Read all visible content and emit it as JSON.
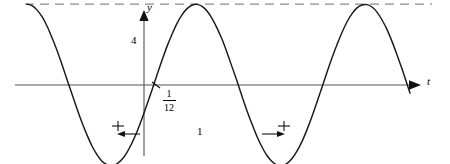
{
  "figure": {
    "title": "",
    "axis_labels": {
      "y": "y",
      "t": "t"
    },
    "annotations": {
      "amplitude_value": "4",
      "period_value": "1",
      "phase_shift_numerator": "1",
      "phase_shift_denominator": "12"
    },
    "icons": {
      "y_axis_arrow": "arrow-up-icon",
      "t_axis_arrow": "arrow-right-icon",
      "shift_arrow_left": "arrow-left-icon",
      "shift_arrow_right": "arrow-right-icon"
    },
    "colors": {
      "curve": "#1a1a1a",
      "axis": "#555555",
      "dashed": "#8c8c8c",
      "background": "#ffffff"
    }
  },
  "chart_data": {
    "type": "line",
    "title": "",
    "xlabel": "t",
    "ylabel": "y",
    "grid": false,
    "legend": null,
    "xlim": [
      -0.71,
      2.02
    ],
    "ylim": [
      -4.6,
      5.2
    ],
    "axis_origin_px": {
      "x": 144,
      "y": 85
    },
    "px_per_unit_x": 165,
    "px_per_unit_y": 20.2,
    "function": "y = 4 cos(2*pi*(t - 1/12))",
    "amplitude": 4,
    "period": 1,
    "midline": 0,
    "phase_shift": 0.0833,
    "reference_lines": [
      {
        "label": "4",
        "y": 4,
        "style": "dashed"
      },
      {
        "label": "",
        "y": -4,
        "style": "dashed"
      }
    ],
    "key_points": [
      {
        "name": "start",
        "t": -0.709,
        "y": 4.0
      },
      {
        "name": "minimum",
        "t": -0.145,
        "y": -4.0
      },
      {
        "name": "zero-rising",
        "t": 0.079,
        "y": 0.0
      },
      {
        "name": "maximum",
        "t": 0.358,
        "y": 4.0
      },
      {
        "name": "minimum",
        "t": 0.855,
        "y": -4.0
      },
      {
        "name": "maximum",
        "t": 1.358,
        "y": 4.0
      },
      {
        "name": "end",
        "t": 1.612,
        "y": 0.0
      }
    ],
    "series": [
      {
        "name": "y(t)",
        "x": [
          -0.709,
          -0.679,
          -0.649,
          -0.618,
          -0.588,
          -0.558,
          -0.527,
          -0.497,
          -0.467,
          -0.436,
          -0.406,
          -0.376,
          -0.345,
          -0.315,
          -0.285,
          -0.255,
          -0.224,
          -0.194,
          -0.164,
          -0.133,
          -0.103,
          -0.073,
          -0.042,
          -0.012,
          0.018,
          0.049,
          0.079,
          0.109,
          0.139,
          0.17,
          0.2,
          0.23,
          0.261,
          0.291,
          0.321,
          0.352,
          0.382,
          0.412,
          0.442,
          0.473,
          0.503,
          0.533,
          0.564,
          0.594,
          0.624,
          0.655,
          0.685,
          0.715,
          0.745,
          0.776,
          0.806,
          0.836,
          0.867,
          0.897,
          0.927,
          0.958,
          0.988,
          1.018,
          1.048,
          1.079,
          1.109,
          1.139,
          1.17,
          1.2,
          1.23,
          1.261,
          1.291,
          1.321,
          1.352,
          1.382,
          1.412,
          1.442,
          1.473,
          1.503,
          1.533,
          1.564,
          1.594,
          1.612
        ],
        "y": [
          4.0,
          3.93,
          3.72,
          3.38,
          2.92,
          2.35,
          1.71,
          1.01,
          0.28,
          -0.46,
          -1.18,
          -1.86,
          -2.48,
          -3.02,
          -3.45,
          -3.77,
          -3.94,
          -3.99,
          -3.9,
          -3.68,
          -3.33,
          -2.87,
          -2.3,
          -1.66,
          -0.96,
          -0.23,
          0.51,
          1.22,
          1.9,
          2.51,
          3.05,
          3.47,
          3.78,
          3.95,
          3.99,
          3.89,
          3.66,
          3.3,
          2.83,
          2.26,
          1.61,
          0.91,
          0.18,
          -0.56,
          -1.27,
          -1.94,
          -2.55,
          -3.07,
          -3.49,
          -3.79,
          -3.96,
          -3.99,
          -3.88,
          -3.64,
          -3.27,
          -2.79,
          -2.21,
          -1.56,
          -0.85,
          -0.11,
          0.63,
          1.34,
          2.01,
          2.6,
          3.12,
          3.53,
          3.82,
          3.96,
          3.98,
          3.86,
          3.61,
          3.23,
          2.74,
          2.16,
          1.5,
          0.79,
          0.05,
          -0.4
        ]
      }
    ]
  }
}
